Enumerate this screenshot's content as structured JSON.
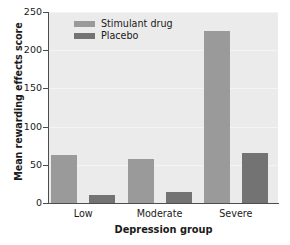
{
  "chart_data": {
    "type": "bar",
    "title": "",
    "xlabel": "Depression group",
    "ylabel": "Mean rewarding effects score",
    "categories": [
      "Low",
      "Moderate",
      "Severe"
    ],
    "series": [
      {
        "name": "Stimulant drug",
        "color": "#9a9a9a",
        "values": [
          63,
          57,
          225
        ]
      },
      {
        "name": "Placebo",
        "color": "#737373",
        "values": [
          11,
          15,
          65
        ]
      }
    ],
    "ylim": [
      0,
      250
    ],
    "yticks": [
      0,
      50,
      100,
      150,
      200,
      250
    ],
    "ytick_labels": [
      "0",
      "50",
      "100",
      "150",
      "200",
      "250"
    ],
    "grid": true,
    "grid_axis": "y",
    "legend_position": "upper-left-inside",
    "plot_background": "#ebebeb",
    "figure_background": "#ffffff",
    "axis_color": "#4d4d4d",
    "text_color": "#1a1a1a"
  },
  "legend": {
    "entries": [
      {
        "label": "Stimulant drug",
        "swatch": "#9a9a9a"
      },
      {
        "label": "Placebo",
        "swatch": "#737373"
      }
    ]
  }
}
